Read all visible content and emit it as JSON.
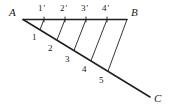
{
  "figure": {
    "stroke_color": "#1f1f1f",
    "background_color": "#ffffff",
    "vertices": [
      {
        "name": "A",
        "label": "A",
        "x": 23,
        "y": 19,
        "label_x": 9,
        "label_y": 7
      },
      {
        "name": "B",
        "label": "B",
        "x": 127,
        "y": 19,
        "label_x": 131,
        "label_y": 7
      },
      {
        "name": "C",
        "label": "C",
        "x": 150,
        "y": 97,
        "label_x": 154,
        "label_y": 93
      }
    ],
    "rays": [
      {
        "name": "ray-AB",
        "from": "A",
        "to": "B",
        "x1": 23,
        "y1": 19.5,
        "x2": 127,
        "y2": 19.5
      },
      {
        "name": "ray-AC",
        "from": "A",
        "to": "C",
        "x1": 23,
        "y1": 19.5,
        "x2": 150,
        "y2": 97
      }
    ],
    "top_points": [
      {
        "label": "1'",
        "digit": "1",
        "prime": "'",
        "x": 44,
        "y": 19.5,
        "label_x": 38,
        "label_y": 4
      },
      {
        "label": "2'",
        "digit": "2",
        "prime": "'",
        "x": 65,
        "y": 19.5,
        "label_x": 60,
        "label_y": 4
      },
      {
        "label": "3'",
        "digit": "3",
        "prime": "'",
        "x": 86,
        "y": 19.5,
        "label_x": 81,
        "label_y": 4
      },
      {
        "label": "4'",
        "digit": "4",
        "prime": "'",
        "x": 107,
        "y": 19.5,
        "label_x": 102,
        "label_y": 4
      }
    ],
    "diagonal_points": [
      {
        "label": "1",
        "x": 40,
        "y": 29.6,
        "label_x": 32,
        "label_y": 33
      },
      {
        "label": "2",
        "x": 57,
        "y": 40.0,
        "label_x": 48,
        "label_y": 44
      },
      {
        "label": "3",
        "x": 74,
        "y": 50.4,
        "label_x": 65,
        "label_y": 55
      },
      {
        "label": "4",
        "x": 91,
        "y": 60.7,
        "label_x": 82,
        "label_y": 65
      },
      {
        "label": "5",
        "x": 108,
        "y": 71.1,
        "label_x": 99,
        "label_y": 76
      }
    ],
    "connectors": [
      {
        "name": "connector-1",
        "x1": 44,
        "y1": 19.5,
        "x2": 40,
        "y2": 29.6
      },
      {
        "name": "connector-2",
        "x1": 65,
        "y1": 19.5,
        "x2": 57,
        "y2": 40.0
      },
      {
        "name": "connector-3",
        "x1": 86,
        "y1": 19.5,
        "x2": 74,
        "y2": 50.4
      },
      {
        "name": "connector-4",
        "x1": 107,
        "y1": 19.5,
        "x2": 91,
        "y2": 60.7
      },
      {
        "name": "connector-5",
        "x1": 127,
        "y1": 19.5,
        "x2": 108,
        "y2": 71.1
      }
    ],
    "tick_marks": [
      {
        "name": "tick-1",
        "x": 44,
        "y_top": 17.0,
        "y_bottom": 22.0
      },
      {
        "name": "tick-2",
        "x": 65,
        "y_top": 17.0,
        "y_bottom": 22.0
      },
      {
        "name": "tick-3",
        "x": 86,
        "y_top": 17.0,
        "y_bottom": 22.0
      },
      {
        "name": "tick-4",
        "x": 107,
        "y_top": 17.0,
        "y_bottom": 22.0
      }
    ]
  }
}
